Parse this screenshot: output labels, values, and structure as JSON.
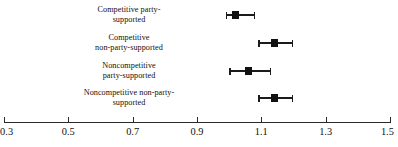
{
  "chart_data": {
    "type": "scatter",
    "title": "",
    "subtitle": "",
    "xlabel": "",
    "ylabel": "",
    "grid": false,
    "legend": "none",
    "orientation": "horizontal",
    "marker": "square",
    "error_bars": "horizontal",
    "xlim": [
      0.3,
      1.5
    ],
    "xticks": [
      0.3,
      0.5,
      0.7,
      0.9,
      1.1,
      1.3,
      1.5
    ],
    "xtick_labels": [
      "0.3",
      "0.5",
      "0.7",
      "0.9",
      "1.1",
      "1.3",
      "1.5"
    ],
    "categories": [
      "Competitive party-supported",
      "Competitive non-party-supported",
      "Noncompetitive party-supported",
      "Noncompetitive non-party-supported"
    ],
    "category_label_lines": [
      [
        "Competitive party-",
        "supported"
      ],
      [
        "Competitive",
        "non-party-supported"
      ],
      [
        "Noncompetitive",
        "party-supported"
      ],
      [
        "Noncompetitive non-party-",
        "supported"
      ]
    ],
    "values": [
      1.02,
      1.14,
      1.06,
      1.14
    ],
    "ci_low": [
      0.99,
      1.09,
      1.0,
      1.09
    ],
    "ci_high": [
      1.08,
      1.2,
      1.13,
      1.2
    ],
    "points": [
      {
        "label_line1": "Competitive party-",
        "label_line2": "supported",
        "estimate": 1.02,
        "ci_low": 0.99,
        "ci_high": 1.08
      },
      {
        "label_line1": "Competitive",
        "label_line2": "non-party-supported",
        "estimate": 1.14,
        "ci_low": 1.09,
        "ci_high": 1.2
      },
      {
        "label_line1": "Noncompetitive",
        "label_line2": "party-supported",
        "estimate": 1.06,
        "ci_low": 1.0,
        "ci_high": 1.13
      },
      {
        "label_line1": "Noncompetitive non-party-",
        "label_line2": "supported",
        "estimate": 1.14,
        "ci_low": 1.09,
        "ci_high": 1.2
      }
    ],
    "colors": {
      "marker": "#111111",
      "error_bar": "#1b1b1b",
      "axis": "#2a2a2a",
      "text": "#101010",
      "background": "#ffffff"
    }
  }
}
